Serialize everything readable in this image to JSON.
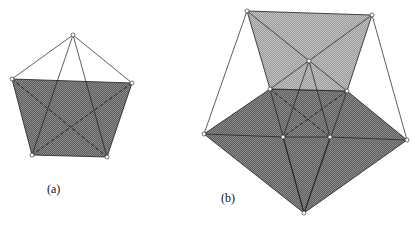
{
  "figures": [
    {
      "id": "a",
      "label": "(a)",
      "label_pos": [
        47,
        182
      ],
      "vertices": {
        "apex": [
          73,
          35
        ],
        "left": [
          12,
          79
        ],
        "right": [
          132,
          83
        ],
        "bottom_left": [
          32,
          155
        ],
        "bottom_right": [
          107,
          157
        ]
      }
    },
    {
      "id": "b",
      "label": "(b)",
      "label_pos": [
        221,
        191
      ],
      "vertices": {
        "top_left": [
          247,
          11
        ],
        "top_right": [
          372,
          15
        ],
        "apex": [
          309,
          61
        ],
        "inner_left": [
          270,
          89
        ],
        "inner_right": [
          347,
          91
        ],
        "far_left": [
          204,
          134
        ],
        "mid_left": [
          283,
          137
        ],
        "mid_right": [
          330,
          137
        ],
        "far_right": [
          407,
          140
        ],
        "bottom": [
          304,
          213
        ]
      }
    }
  ],
  "colors": {
    "dark_fill": "#6e6e6e",
    "light_fill": "#a8a8a8",
    "line": "#1a1a1a",
    "vertex_fill": "#ffffff"
  }
}
